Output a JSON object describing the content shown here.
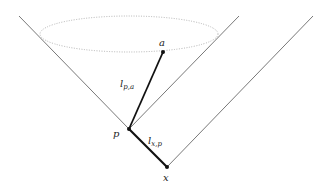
{
  "diagram": {
    "type": "light-cone",
    "colors": {
      "cone_line": "#555555",
      "path_line": "#111111",
      "ellipse": "#aaaaaa",
      "background": "#ffffff"
    },
    "points": {
      "a": {
        "label": "a",
        "x": 163,
        "y": 52
      },
      "p": {
        "label": "p",
        "x": 129,
        "y": 129
      },
      "x": {
        "label": "x",
        "x": 167,
        "y": 167
      }
    },
    "labels": {
      "a": "a",
      "p": "p",
      "x": "x",
      "l_pa_main": "l",
      "l_pa_sub": "p,a",
      "l_xp_main": "l",
      "l_xp_sub": "x,p"
    },
    "cones": [
      {
        "name": "future-cone-of-p",
        "apex": [
          129,
          129
        ],
        "left_top": [
          19,
          16
        ],
        "right_top": [
          239,
          16
        ]
      },
      {
        "name": "future-cone-of-x-right-edge",
        "apex": [
          167,
          167
        ],
        "right_top": [
          313,
          16
        ]
      }
    ],
    "ellipse": {
      "cx": 129,
      "cy": 34,
      "rx": 89,
      "ry": 18,
      "style": "dotted"
    },
    "segments": [
      {
        "name": "l_p_a",
        "from": "p",
        "to": "a"
      },
      {
        "name": "l_x_p",
        "from": "x",
        "to": "p"
      }
    ]
  }
}
